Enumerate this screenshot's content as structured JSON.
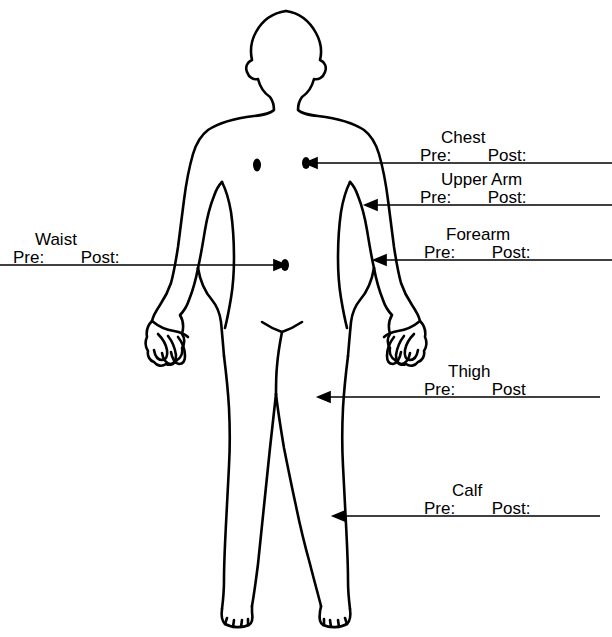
{
  "document": {
    "type": "body-measurement-diagram",
    "figure": "human-body-outline-front-view",
    "ink_color": "#000000",
    "background_color": "#ffffff"
  },
  "annotations": [
    {
      "id": "chest",
      "title": "Chest",
      "pre_label": "Pre:",
      "post_label": "Post:",
      "arrow_direction": "left"
    },
    {
      "id": "upper-arm",
      "title": "Upper Arm",
      "pre_label": "Pre:",
      "post_label": "Post:",
      "arrow_direction": "left"
    },
    {
      "id": "forearm",
      "title": "Forearm",
      "pre_label": "Pre:",
      "post_label": "Post:",
      "arrow_direction": "left"
    },
    {
      "id": "waist",
      "title": "Waist",
      "pre_label": "Pre:",
      "post_label": "Post:",
      "arrow_direction": "right"
    },
    {
      "id": "thigh",
      "title": "Thigh",
      "pre_label": "Pre:",
      "post_label": "Post",
      "arrow_direction": "left"
    },
    {
      "id": "calf",
      "title": "Calf",
      "pre_label": "Pre:",
      "post_label": "Post:",
      "arrow_direction": "left"
    }
  ]
}
